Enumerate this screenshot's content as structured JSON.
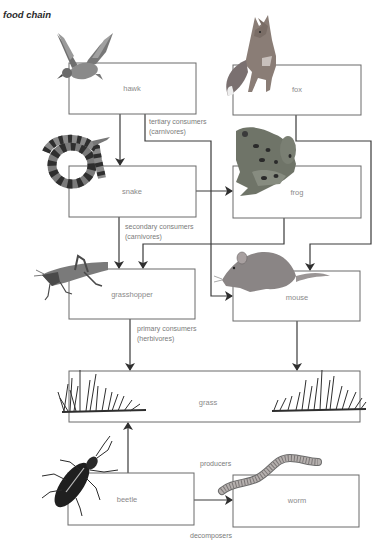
{
  "title": "food chain",
  "nodes": {
    "hawk": {
      "label": "hawk",
      "icon": "hawk-icon"
    },
    "fox": {
      "label": "fox",
      "icon": "fox-icon"
    },
    "snake": {
      "label": "snake",
      "icon": "snake-icon"
    },
    "frog": {
      "label": "frog",
      "icon": "frog-icon"
    },
    "grasshopper": {
      "label": "grasshopper",
      "icon": "grasshopper-icon"
    },
    "mouse": {
      "label": "mouse",
      "icon": "mouse-icon"
    },
    "grass": {
      "label": "grass",
      "icon": "grass-icon"
    },
    "beetle": {
      "label": "beetle",
      "icon": "beetle-icon"
    },
    "worm": {
      "label": "worm",
      "icon": "worm-icon"
    }
  },
  "annotations": {
    "tertiary": {
      "line1": "tertiary consumers",
      "line2": "(carnivores)"
    },
    "secondary": {
      "line1": "secondary consumers",
      "line2": "(carnivores)"
    },
    "primary": {
      "line1": "primary consumers",
      "line2": "(herbivores)"
    },
    "producers": "producers",
    "decomposers": "decomposers"
  },
  "edges": [
    {
      "from": "hawk",
      "to": "snake"
    },
    {
      "from": "hawk",
      "to": "mouse"
    },
    {
      "from": "fox",
      "to": "mouse"
    },
    {
      "from": "snake",
      "to": "frog"
    },
    {
      "from": "snake",
      "to": "grasshopper"
    },
    {
      "from": "frog",
      "to": "grasshopper"
    },
    {
      "from": "grasshopper",
      "to": "grass"
    },
    {
      "from": "mouse",
      "to": "grass"
    },
    {
      "from": "beetle",
      "to": "grass"
    },
    {
      "from": "beetle",
      "to": "worm"
    }
  ],
  "colors": {
    "line": "#3a3a3a",
    "box_border": "#6a6a6a",
    "label": "#8a8a8a"
  }
}
